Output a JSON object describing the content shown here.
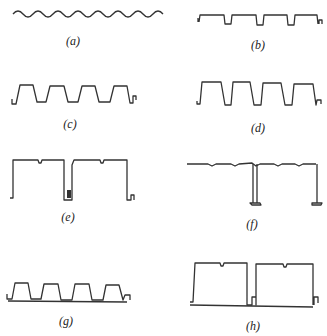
{
  "figure": {
    "stroke_color": "#333333",
    "background": "#ffffff",
    "panels": [
      {
        "id": "a",
        "label": "(a)",
        "description": "sinusoidal corrugated sheet"
      },
      {
        "id": "b",
        "label": "(b)",
        "description": "wide-rib trapezoidal deck with narrow troughs"
      },
      {
        "id": "c",
        "label": "(c)",
        "description": "trapezoidal profiled sheet"
      },
      {
        "id": "d",
        "label": "(d)",
        "description": "deep trapezoidal profiled sheet"
      },
      {
        "id": "e",
        "label": "(e)",
        "description": "standing-seam box panel"
      },
      {
        "id": "f",
        "label": "(f)",
        "description": "flat panel with T-flange ribs"
      },
      {
        "id": "g",
        "label": "(g)",
        "description": "trapezoidal sheet on flat base (composite)"
      },
      {
        "id": "h",
        "label": "(h)",
        "description": "closed box panels on flat base"
      }
    ]
  }
}
